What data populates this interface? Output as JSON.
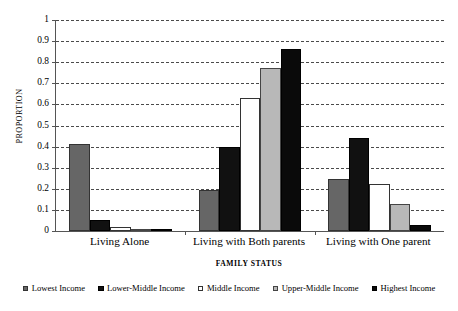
{
  "chart_data": {
    "type": "bar",
    "title": "",
    "xlabel": "FAMILY STATUS",
    "ylabel": "PROPORTION",
    "ylim": [
      0,
      1
    ],
    "ytick_labels": [
      "1",
      "0.9",
      "0.8",
      "0.7",
      "0.6",
      "0.5",
      "0.4",
      "0.3",
      "0.2",
      "0.1",
      "0"
    ],
    "ytick_values": [
      1,
      0.9,
      0.8,
      0.7,
      0.6,
      0.5,
      0.4,
      0.3,
      0.2,
      0.1,
      0
    ],
    "grid": true,
    "legend_position": "bottom",
    "categories": [
      "Living Alone",
      "Living with Both parents",
      "Living with One parent"
    ],
    "series": [
      {
        "name": "Lowest Income",
        "color": "#666666",
        "border": "#333333",
        "values": [
          0.412,
          0.196,
          0.245
        ]
      },
      {
        "name": "Lower-Middle Income",
        "color": "#111111",
        "border": "#000000",
        "values": [
          0.052,
          0.396,
          0.441
        ]
      },
      {
        "name": "Middle Income",
        "color": "#ffffff",
        "border": "#333333",
        "values": [
          0.02,
          0.63,
          0.221
        ]
      },
      {
        "name": "Upper-Middle Income",
        "color": "#b8b8b8",
        "border": "#444444",
        "values": [
          0.008,
          0.771,
          0.126
        ]
      },
      {
        "name": "Highest Income",
        "color": "#0a0a0a",
        "border": "#000000",
        "values": [
          0.005,
          0.861,
          0.03
        ]
      }
    ]
  }
}
